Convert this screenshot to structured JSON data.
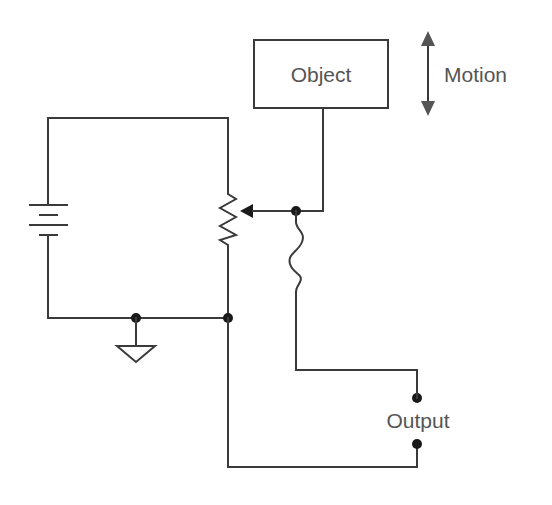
{
  "diagram": {
    "type": "circuit-schematic",
    "labels": {
      "object": "Object",
      "motion": "Motion",
      "output": "Output"
    },
    "components": [
      {
        "id": "battery",
        "kind": "voltage-source"
      },
      {
        "id": "potentiometer",
        "kind": "variable-resistor-with-wiper"
      },
      {
        "id": "object",
        "kind": "block",
        "label": "Object"
      },
      {
        "id": "motion-arrow",
        "kind": "bidirectional-arrow",
        "label": "Motion"
      },
      {
        "id": "flex-lead",
        "kind": "flexible-wire"
      },
      {
        "id": "ground",
        "kind": "ground-symbol"
      },
      {
        "id": "output-terminals",
        "kind": "terminal-pair",
        "label": "Output"
      }
    ],
    "colors": {
      "wire": "#3a3a3a",
      "text": "#555555",
      "node": "#1a1a1a",
      "background": "#ffffff"
    }
  }
}
